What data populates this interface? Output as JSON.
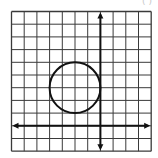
{
  "header_fragment": "( )",
  "grid": {
    "columns": 11,
    "rows": 11,
    "origin_px": [
      11.5,
      11.5
    ],
    "cell_px": 12.7,
    "line_color": "#3a3a3a",
    "border_color": "#555555"
  },
  "axes": {
    "y_axis_column": 7,
    "x_axis_row": 9,
    "color": "#111111",
    "arrows": true
  },
  "circle": {
    "center_grid": [
      -2,
      3
    ],
    "radius_units": 2,
    "tangent_to": "y-axis",
    "stroke": "#111111"
  }
}
